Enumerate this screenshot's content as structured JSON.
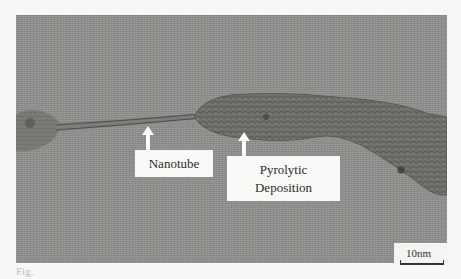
{
  "figure": {
    "type": "TEM micrograph",
    "labels": {
      "nanotube": "Nanotube",
      "pyrolytic_line1": "Pyrolytic",
      "pyrolytic_line2": "Deposition"
    },
    "scale_bar": {
      "label": "10nm"
    },
    "caption_fragment": "Fig."
  },
  "colors": {
    "background_gray": "#8e8e8b",
    "label_box": "#f9f9f7",
    "text": "#2b2b2b",
    "page": "#f7f7f5"
  }
}
